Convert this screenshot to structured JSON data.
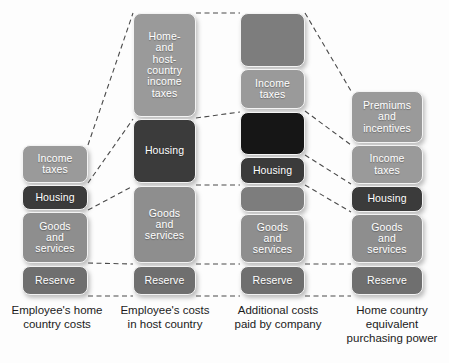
{
  "diagram": {
    "colors": {
      "box_light": "#9a9a9a",
      "box_mid": "#8e8e8e",
      "box_medium": "#7d7d7d",
      "box_dark": "#6f6f6f",
      "box_deep": "#3b3b3b",
      "box_black": "#161616",
      "connector": "#4a4a4a",
      "background": "#fdfdfd",
      "box_text": "#ffffff",
      "caption_text": "#1b1b1b"
    },
    "columns": [
      {
        "id": "employee-home-country-costs",
        "caption": "Employee's home\ncountry costs",
        "boxes": [
          {
            "label": "Income\ntaxes",
            "shade": "light",
            "x": 22,
            "y": 145,
            "w": 66,
            "h": 38
          },
          {
            "label": "Housing",
            "shade": "deep",
            "x": 22,
            "y": 185,
            "w": 66,
            "h": 25
          },
          {
            "label": "Goods\nand\nservices",
            "shade": "mid",
            "x": 22,
            "y": 212,
            "w": 66,
            "h": 51
          },
          {
            "label": "Reserve",
            "shade": "dark",
            "x": 22,
            "y": 266,
            "w": 66,
            "h": 29
          }
        ]
      },
      {
        "id": "employee-costs-in-host-country",
        "caption": "Employee's costs\nin host country",
        "boxes": [
          {
            "label": "Home-\nand\nhost-\ncountry\nincome\ntaxes",
            "shade": "light",
            "x": 133,
            "y": 13,
            "w": 63,
            "h": 104
          },
          {
            "label": "Housing",
            "shade": "deep",
            "x": 133,
            "y": 119,
            "w": 63,
            "h": 64
          },
          {
            "label": "Goods\nand\nservices",
            "shade": "mid",
            "x": 133,
            "y": 186,
            "w": 63,
            "h": 77
          },
          {
            "label": "Reserve",
            "shade": "dark",
            "x": 133,
            "y": 266,
            "w": 63,
            "h": 29
          }
        ]
      },
      {
        "id": "additional-costs-paid-by-company",
        "caption": "Additional costs\npaid by company",
        "boxes": [
          {
            "label": "",
            "shade": "medium",
            "x": 240,
            "y": 13,
            "w": 65,
            "h": 54
          },
          {
            "label": "Income\ntaxes",
            "shade": "light",
            "x": 240,
            "y": 69,
            "w": 65,
            "h": 40
          },
          {
            "label": "",
            "shade": "black",
            "x": 240,
            "y": 112,
            "w": 65,
            "h": 43
          },
          {
            "label": "Housing",
            "shade": "deep",
            "x": 240,
            "y": 157,
            "w": 65,
            "h": 27
          },
          {
            "label": "",
            "shade": "medium",
            "x": 240,
            "y": 186,
            "w": 65,
            "h": 26
          },
          {
            "label": "Goods\nand\nservices",
            "shade": "mid",
            "x": 240,
            "y": 214,
            "w": 65,
            "h": 49
          },
          {
            "label": "Reserve",
            "shade": "dark",
            "x": 240,
            "y": 266,
            "w": 65,
            "h": 29
          }
        ]
      },
      {
        "id": "home-country-equivalent-purchasing-power",
        "caption": "Home country\nequivalent\npurchasing power",
        "boxes": [
          {
            "label": "Premiums\nand\nincentives",
            "shade": "light",
            "x": 351,
            "y": 91,
            "w": 72,
            "h": 52
          },
          {
            "label": "Income\ntaxes",
            "shade": "light",
            "x": 351,
            "y": 145,
            "w": 72,
            "h": 39
          },
          {
            "label": "Housing",
            "shade": "deep",
            "x": 351,
            "y": 186,
            "w": 72,
            "h": 26
          },
          {
            "label": "Goods\nand\nservices",
            "shade": "mid",
            "x": 351,
            "y": 214,
            "w": 72,
            "h": 49
          },
          {
            "label": "Reserve",
            "shade": "dark",
            "x": 351,
            "y": 266,
            "w": 72,
            "h": 29
          }
        ]
      }
    ],
    "captions": [
      {
        "text": "Employee's home\ncountry costs",
        "x": 5,
        "y": 303,
        "w": 104
      },
      {
        "text": "Employee's costs\nin host country",
        "x": 112,
        "y": 303,
        "w": 106
      },
      {
        "text": "Additional costs\npaid by company",
        "x": 226,
        "y": 303,
        "w": 104
      },
      {
        "text": "Home country\nequivalent\npurchasing power",
        "x": 338,
        "y": 303,
        "w": 108
      }
    ],
    "connectors": [
      {
        "from": "col1-income-taxes-top",
        "x1": 88,
        "y1": 145,
        "x2": 133,
        "y2": 13
      },
      {
        "from": "col1-income-taxes-bottom",
        "x1": 88,
        "y1": 183,
        "x2": 133,
        "y2": 119
      },
      {
        "from": "col1-housing-bottom",
        "x1": 88,
        "y1": 210,
        "x2": 133,
        "y2": 186
      },
      {
        "from": "col1-goods-bottom",
        "x1": 88,
        "y1": 263,
        "x2": 133,
        "y2": 264
      },
      {
        "from": "col1-reserve-bottom",
        "x1": 88,
        "y1": 296,
        "x2": 133,
        "y2": 296
      },
      {
        "from": "col2-top-to-col3-top",
        "x1": 196,
        "y1": 13,
        "x2": 240,
        "y2": 13
      },
      {
        "from": "col2-taxes-bottom-to-col3",
        "x1": 196,
        "y1": 118,
        "x2": 240,
        "y2": 112
      },
      {
        "from": "col2-housing-bottom-to-col3",
        "x1": 196,
        "y1": 185,
        "x2": 240,
        "y2": 185
      },
      {
        "from": "col2-goods-bottom-to-col3",
        "x1": 196,
        "y1": 264,
        "x2": 240,
        "y2": 264
      },
      {
        "from": "col2-reserve-bottom-to-col3",
        "x1": 196,
        "y1": 296,
        "x2": 240,
        "y2": 296
      },
      {
        "from": "col3-top-to-col4-top",
        "x1": 305,
        "y1": 13,
        "x2": 351,
        "y2": 91
      },
      {
        "from": "col3-taxes-to-col4-taxes",
        "x1": 305,
        "y1": 111,
        "x2": 351,
        "y2": 145
      },
      {
        "from": "col3-black-to-col4-taxes-bot",
        "x1": 305,
        "y1": 155,
        "x2": 351,
        "y2": 184
      },
      {
        "from": "col3-housing-to-col4-housing",
        "x1": 305,
        "y1": 185,
        "x2": 351,
        "y2": 212
      },
      {
        "from": "col3-goods-bottom-to-col4",
        "x1": 305,
        "y1": 264,
        "x2": 351,
        "y2": 264
      },
      {
        "from": "col3-reserve-bottom-to-col4",
        "x1": 305,
        "y1": 296,
        "x2": 351,
        "y2": 296
      }
    ]
  }
}
